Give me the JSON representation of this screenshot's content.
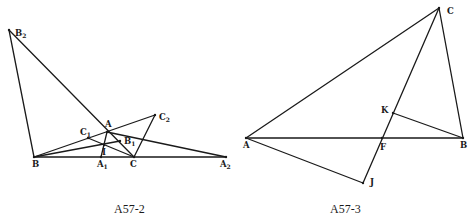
{
  "figures": [
    {
      "id": "A57-2",
      "caption": "A57-2",
      "points": {
        "B2": {
          "label": "B",
          "sub": "2",
          "x": 9,
          "y": 30,
          "lx": 15,
          "ly": 36
        },
        "B": {
          "label": "B",
          "sub": "",
          "x": 34,
          "y": 157,
          "lx": 32,
          "ly": 167
        },
        "A": {
          "label": "A",
          "sub": "",
          "x": 107,
          "y": 132,
          "lx": 105,
          "ly": 127
        },
        "C1": {
          "label": "C",
          "sub": "1",
          "x": 88,
          "y": 138,
          "lx": 80,
          "ly": 135
        },
        "C2": {
          "label": "C",
          "sub": "2",
          "x": 155,
          "y": 115,
          "lx": 159,
          "ly": 120
        },
        "B1": {
          "label": "B",
          "sub": "1",
          "x": 120,
          "y": 141,
          "lx": 124,
          "ly": 144
        },
        "I": {
          "label": "I",
          "sub": "",
          "x": 104,
          "y": 145,
          "lx": 102,
          "ly": 155
        },
        "A1": {
          "label": "A",
          "sub": "1",
          "x": 101,
          "y": 157,
          "lx": 97,
          "ly": 167
        },
        "C": {
          "label": "C",
          "sub": "",
          "x": 134,
          "y": 157,
          "lx": 130,
          "ly": 167
        },
        "A2": {
          "label": "A",
          "sub": "2",
          "x": 226,
          "y": 157,
          "lx": 220,
          "ly": 167
        }
      },
      "segments": [
        [
          "B2",
          "B"
        ],
        [
          "B2",
          "C"
        ],
        [
          "B",
          "A2"
        ],
        [
          "B",
          "C2"
        ],
        [
          "C2",
          "C"
        ],
        [
          "A",
          "A2"
        ],
        [
          "B",
          "B1"
        ],
        [
          "C1",
          "C"
        ],
        [
          "A",
          "A1"
        ]
      ],
      "caption_pos": {
        "x": 114,
        "y": 213
      }
    },
    {
      "id": "A57-3",
      "caption": "A57-3",
      "points": {
        "C": {
          "label": "C",
          "sub": "",
          "x": 439,
          "y": 8,
          "lx": 447,
          "ly": 14
        },
        "A": {
          "label": "A",
          "sub": "",
          "x": 246,
          "y": 138,
          "lx": 243,
          "ly": 148
        },
        "B": {
          "label": "B",
          "sub": "",
          "x": 463,
          "y": 138,
          "lx": 460,
          "ly": 148
        },
        "K": {
          "label": "K",
          "sub": "",
          "x": 393,
          "y": 113,
          "lx": 381,
          "ly": 113
        },
        "F": {
          "label": "F",
          "sub": "",
          "x": 382,
          "y": 138,
          "lx": 380,
          "ly": 150
        },
        "J": {
          "label": "J",
          "sub": "",
          "x": 363,
          "y": 183,
          "lx": 370,
          "ly": 185
        }
      },
      "segments": [
        [
          "A",
          "C"
        ],
        [
          "C",
          "B"
        ],
        [
          "A",
          "B"
        ],
        [
          "C",
          "J"
        ],
        [
          "A",
          "J"
        ],
        [
          "K",
          "B"
        ]
      ],
      "caption_pos": {
        "x": 330,
        "y": 213
      }
    }
  ]
}
